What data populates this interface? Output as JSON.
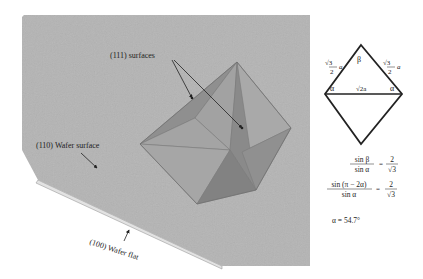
{
  "figure": {
    "labels": {
      "surfaces_111": "(111) surfaces",
      "wafer_surface_110": "(110) Wafer surface",
      "wafer_flat_100": "(100) Wafer flat"
    },
    "triangle": {
      "side_left_coef": "√3",
      "side_left_den": "2",
      "side_var": "a",
      "side_right_coef": "√3",
      "side_right_den": "2",
      "base": "√2a",
      "angle_top": "β",
      "angle_left": "α",
      "angle_right": "α"
    },
    "equations": {
      "eq1_num": "sin β",
      "eq1_den": "sin α",
      "eq1_eq": "=",
      "eq1_rhs_num": "2",
      "eq1_rhs_den": "√3",
      "eq2_num": "sin (π − 2α)",
      "eq2_den": "sin α",
      "eq2_eq": "=",
      "eq2_rhs_num": "2",
      "eq2_rhs_den": "√3",
      "result": "α = 54.7°"
    },
    "colors": {
      "wafer": "#b4b4b4",
      "wafer_edge": "#d8d8d8",
      "face_light": "#a8a8a8",
      "face_mid": "#9a9a9a",
      "face_dark": "#878787",
      "line": "#222222"
    }
  }
}
